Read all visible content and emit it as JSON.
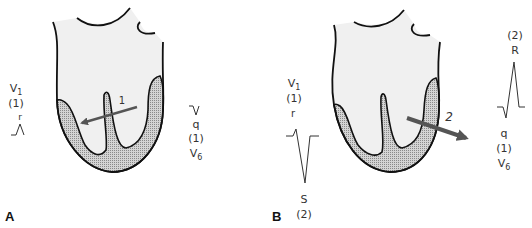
{
  "panels": [
    {
      "letter": "A",
      "vector": {
        "label": "1",
        "direction": "leftward-anterior"
      },
      "left_lead": {
        "lead": "V",
        "lead_sub": "1",
        "phase": "(1)",
        "wave": "r"
      },
      "right_lead": {
        "wave": "q",
        "phase": "(1)",
        "lead": "V",
        "lead_sub": "6"
      }
    },
    {
      "letter": "B",
      "vector": {
        "label": "2",
        "direction": "rightward-posterior"
      },
      "left_lead": {
        "lead": "V",
        "lead_sub": "1",
        "phase": "(1)",
        "wave_top": "r",
        "wave_bottom": "S",
        "phase_bottom": "(2)"
      },
      "right_lead": {
        "phase_top": "(2)",
        "wave_top": "R",
        "wave": "q",
        "phase": "(1)",
        "lead": "V",
        "lead_sub": "6"
      }
    }
  ],
  "colors": {
    "outline": "#111111",
    "cavity_fill": "#f0f0f0",
    "myocardium_fill": "#b8b8b8",
    "arrow": "#555555",
    "text": "#333333"
  }
}
